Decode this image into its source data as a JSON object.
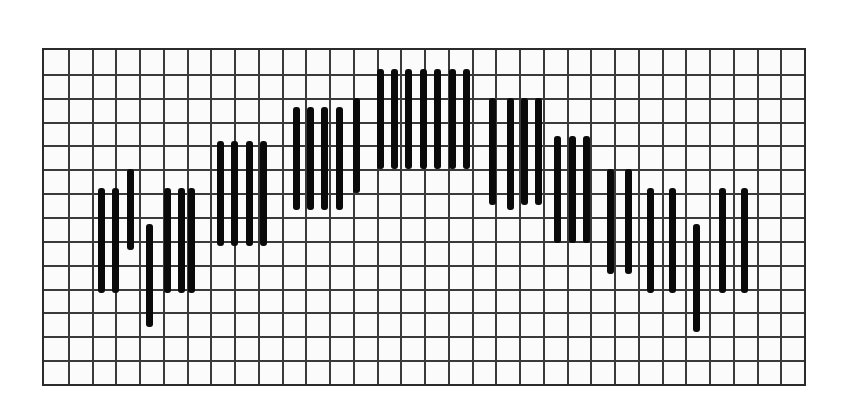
{
  "figure": {
    "title": "",
    "background_color": "#ffffff",
    "plot_background_color": "#fbfbfb",
    "frame_color": "#2b2b2b",
    "bar_color": "#0a0a0a",
    "major_gridline_color": "#3a3a3a",
    "minor_gridline_color": "#8d8d8d"
  },
  "plot_area": {
    "x": 42,
    "y": 48,
    "width": 764,
    "height": 338
  },
  "grid": {
    "cell_width": 23.875,
    "cell_height": 24.14,
    "columns": 32,
    "rows": 14,
    "minor_divisions": 1,
    "grid_visible": true
  },
  "chart_data": {
    "type": "bar",
    "title": "",
    "xlabel": "",
    "ylabel": "",
    "xlim": [
      0,
      32
    ],
    "ylim": [
      0,
      14
    ],
    "grid": true,
    "legend": null,
    "orientation": "vertical",
    "baseline": "floating",
    "note": "Floating vertical bars (range bars) arranged in a broad bell-shaped envelope; each bar is defined by its top and bottom values on the 14-row grid, measured from the bottom of the plot area.",
    "bar_width_px": 7,
    "categories": [
      "1",
      "2",
      "3",
      "4",
      "5",
      "6",
      "7",
      "8",
      "9",
      "10",
      "11",
      "12",
      "13",
      "14",
      "15",
      "16",
      "17",
      "18",
      "19",
      "20",
      "21",
      "22",
      "23",
      "24",
      "25",
      "26",
      "27",
      "28",
      "29",
      "30",
      "31",
      "32",
      "33",
      "34",
      "35",
      "36",
      "37",
      "38",
      "39",
      "40",
      "41",
      "42",
      "43"
    ],
    "bars": [
      {
        "i": 1,
        "center_x": 101,
        "top": 8.2,
        "bottom": 3.8
      },
      {
        "i": 2,
        "center_x": 115,
        "top": 8.2,
        "bottom": 3.8
      },
      {
        "i": 3,
        "center_x": 130,
        "top": 9.0,
        "bottom": 5.6
      },
      {
        "i": 4,
        "center_x": 149,
        "top": 6.7,
        "bottom": 2.4
      },
      {
        "i": 5,
        "center_x": 167,
        "top": 8.2,
        "bottom": 3.8
      },
      {
        "i": 6,
        "center_x": 181,
        "top": 8.2,
        "bottom": 3.8
      },
      {
        "i": 7,
        "center_x": 191,
        "top": 8.2,
        "bottom": 3.8
      },
      {
        "i": 8,
        "center_x": 220,
        "top": 10.2,
        "bottom": 5.8
      },
      {
        "i": 9,
        "center_x": 234,
        "top": 10.2,
        "bottom": 5.8
      },
      {
        "i": 10,
        "center_x": 249,
        "top": 10.2,
        "bottom": 5.8
      },
      {
        "i": 11,
        "center_x": 263,
        "top": 10.2,
        "bottom": 5.8
      },
      {
        "i": 12,
        "center_x": 296,
        "top": 11.6,
        "bottom": 7.3
      },
      {
        "i": 13,
        "center_x": 310,
        "top": 11.6,
        "bottom": 7.3
      },
      {
        "i": 14,
        "center_x": 324,
        "top": 11.6,
        "bottom": 7.3
      },
      {
        "i": 15,
        "center_x": 339,
        "top": 11.6,
        "bottom": 7.3
      },
      {
        "i": 16,
        "center_x": 356,
        "top": 12.0,
        "bottom": 8.0
      },
      {
        "i": 17,
        "center_x": 380,
        "top": 13.2,
        "bottom": 9.0
      },
      {
        "i": 18,
        "center_x": 394,
        "top": 13.2,
        "bottom": 9.0
      },
      {
        "i": 19,
        "center_x": 408,
        "top": 13.2,
        "bottom": 9.0
      },
      {
        "i": 20,
        "center_x": 423,
        "top": 13.2,
        "bottom": 9.0
      },
      {
        "i": 21,
        "center_x": 437,
        "top": 13.2,
        "bottom": 9.0
      },
      {
        "i": 22,
        "center_x": 452,
        "top": 13.2,
        "bottom": 9.0
      },
      {
        "i": 23,
        "center_x": 466,
        "top": 13.2,
        "bottom": 9.0
      },
      {
        "i": 24,
        "center_x": 492,
        "top": 12.0,
        "bottom": 7.5
      },
      {
        "i": 25,
        "center_x": 510,
        "top": 12.0,
        "bottom": 7.3
      },
      {
        "i": 26,
        "center_x": 524,
        "top": 12.0,
        "bottom": 7.5
      },
      {
        "i": 27,
        "center_x": 538,
        "top": 12.0,
        "bottom": 7.5
      },
      {
        "i": 28,
        "center_x": 557,
        "top": 10.4,
        "bottom": 5.9
      },
      {
        "i": 29,
        "center_x": 572,
        "top": 10.4,
        "bottom": 5.9
      },
      {
        "i": 30,
        "center_x": 586,
        "top": 10.4,
        "bottom": 5.9
      },
      {
        "i": 31,
        "center_x": 610,
        "top": 9.0,
        "bottom": 4.6
      },
      {
        "i": 32,
        "center_x": 628,
        "top": 9.0,
        "bottom": 4.6
      },
      {
        "i": 33,
        "center_x": 650,
        "top": 8.2,
        "bottom": 3.8
      },
      {
        "i": 34,
        "center_x": 672,
        "top": 8.2,
        "bottom": 3.8
      },
      {
        "i": 35,
        "center_x": 696,
        "top": 6.7,
        "bottom": 2.2
      },
      {
        "i": 36,
        "center_x": 722,
        "top": 8.2,
        "bottom": 3.8
      },
      {
        "i": 37,
        "center_x": 744,
        "top": 8.2,
        "bottom": 3.8
      }
    ]
  }
}
